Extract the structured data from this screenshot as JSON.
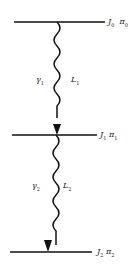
{
  "levels": [
    {
      "spin": "J",
      "spin_sub": "0",
      "parity": "π",
      "parity_sub": "0"
    },
    {
      "spin": "J",
      "spin_sub": "1",
      "parity": "π",
      "parity_sub": "1"
    },
    {
      "spin": "J",
      "spin_sub": "2",
      "parity": "π",
      "parity_sub": "2"
    }
  ],
  "transitions": [
    {
      "gamma": "γ",
      "gamma_sub": "1",
      "mult": "L",
      "mult_sub": "1"
    },
    {
      "gamma": "γ",
      "gamma_sub": "2",
      "mult": "L",
      "mult_sub": "2"
    }
  ],
  "colors": {
    "line": "#111111"
  }
}
